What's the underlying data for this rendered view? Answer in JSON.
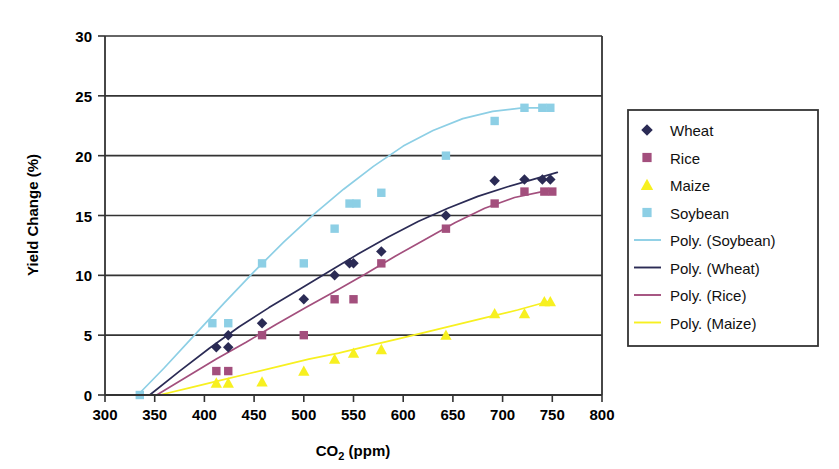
{
  "chart_data": {
    "type": "scatter",
    "title": "",
    "xlabel": "CO2  (ppm)",
    "xlabel_parts": {
      "main": "CO",
      "sub": "2",
      "unit": "(ppm)"
    },
    "ylabel": "Yield Change (%)",
    "xlim": [
      300,
      800
    ],
    "ylim": [
      0,
      30
    ],
    "xticks": [
      300,
      350,
      400,
      450,
      500,
      550,
      600,
      650,
      700,
      750,
      800
    ],
    "yticks": [
      0,
      5,
      10,
      15,
      20,
      25,
      30
    ],
    "xtick_labels": [
      "300",
      "350",
      "400",
      "450",
      "500",
      "550",
      "600",
      "650",
      "700",
      "750",
      "800"
    ],
    "ytick_labels": [
      "0",
      "5",
      "10",
      "15",
      "20",
      "25",
      "30"
    ],
    "grid": "horizontal",
    "legend_position": "right-outside",
    "series": [
      {
        "name": "Wheat",
        "marker": "diamond",
        "color": "#2b2b55",
        "points": [
          [
            412,
            4.0
          ],
          [
            424,
            4.0
          ],
          [
            424,
            5.0
          ],
          [
            458,
            6.0
          ],
          [
            500,
            8.0
          ],
          [
            531,
            10.0
          ],
          [
            546,
            11.0
          ],
          [
            550,
            11.0
          ],
          [
            578,
            12.0
          ],
          [
            643,
            15.0
          ],
          [
            692,
            17.9
          ],
          [
            722,
            18.0
          ],
          [
            740,
            18.0
          ],
          [
            748,
            18.0
          ]
        ]
      },
      {
        "name": "Rice",
        "marker": "square",
        "color": "#a34f7d",
        "points": [
          [
            412,
            2.0
          ],
          [
            424,
            2.0
          ],
          [
            458,
            5.0
          ],
          [
            500,
            5.0
          ],
          [
            531,
            8.0
          ],
          [
            550,
            8.0
          ],
          [
            578,
            11.0
          ],
          [
            643,
            13.9
          ],
          [
            692,
            16.0
          ],
          [
            722,
            17.0
          ],
          [
            742,
            17.0
          ],
          [
            750,
            17.0
          ]
        ]
      },
      {
        "name": "Maize",
        "marker": "triangle",
        "color": "#f7f020",
        "points": [
          [
            412,
            1.0
          ],
          [
            424,
            1.0
          ],
          [
            458,
            1.1
          ],
          [
            500,
            2.0
          ],
          [
            531,
            3.0
          ],
          [
            550,
            3.5
          ],
          [
            578,
            3.8
          ],
          [
            643,
            5.0
          ],
          [
            692,
            6.8
          ],
          [
            722,
            6.8
          ],
          [
            742,
            7.8
          ],
          [
            748,
            7.8
          ]
        ]
      },
      {
        "name": "Soybean",
        "marker": "square",
        "color": "#8dcfe5",
        "points": [
          [
            335,
            0.0
          ],
          [
            408,
            6.0
          ],
          [
            424,
            6.0
          ],
          [
            458,
            11.0
          ],
          [
            500,
            11.0
          ],
          [
            531,
            13.9
          ],
          [
            546,
            16.0
          ],
          [
            553,
            16.0
          ],
          [
            578,
            16.9
          ],
          [
            643,
            20.0
          ],
          [
            692,
            22.9
          ],
          [
            722,
            24.0
          ],
          [
            740,
            24.0
          ],
          [
            748,
            24.0
          ]
        ]
      }
    ],
    "trendlines": [
      {
        "name": "Poly. (Soybean)",
        "color": "#8dcfe5",
        "path": [
          [
            333,
            0.0
          ],
          [
            360,
            2.3
          ],
          [
            390,
            5.0
          ],
          [
            420,
            7.7
          ],
          [
            450,
            10.3
          ],
          [
            480,
            12.8
          ],
          [
            510,
            15.1
          ],
          [
            540,
            17.2
          ],
          [
            570,
            19.1
          ],
          [
            600,
            20.8
          ],
          [
            630,
            22.1
          ],
          [
            660,
            23.1
          ],
          [
            690,
            23.7
          ],
          [
            720,
            24.0
          ],
          [
            748,
            24.0
          ]
        ]
      },
      {
        "name": "Poly. (Wheat)",
        "color": "#2b2b55",
        "path": [
          [
            345,
            0.0
          ],
          [
            375,
            2.0
          ],
          [
            405,
            3.9
          ],
          [
            435,
            5.7
          ],
          [
            465,
            7.3
          ],
          [
            495,
            8.8
          ],
          [
            525,
            10.3
          ],
          [
            555,
            11.8
          ],
          [
            585,
            13.2
          ],
          [
            615,
            14.5
          ],
          [
            645,
            15.6
          ],
          [
            675,
            16.6
          ],
          [
            705,
            17.4
          ],
          [
            730,
            18.0
          ],
          [
            755,
            18.6
          ]
        ]
      },
      {
        "name": "Poly. (Rice)",
        "color": "#a34f7d",
        "path": [
          [
            352,
            0.0
          ],
          [
            382,
            1.5
          ],
          [
            412,
            3.0
          ],
          [
            442,
            4.4
          ],
          [
            472,
            5.9
          ],
          [
            502,
            7.3
          ],
          [
            532,
            8.7
          ],
          [
            562,
            10.1
          ],
          [
            592,
            11.6
          ],
          [
            622,
            13.0
          ],
          [
            652,
            14.4
          ],
          [
            682,
            15.6
          ],
          [
            712,
            16.5
          ],
          [
            740,
            17.0
          ],
          [
            752,
            17.1
          ]
        ]
      },
      {
        "name": "Poly. (Maize)",
        "color": "#f7f020",
        "path": [
          [
            355,
            0.0
          ],
          [
            385,
            0.6
          ],
          [
            415,
            1.2
          ],
          [
            445,
            1.8
          ],
          [
            475,
            2.4
          ],
          [
            505,
            3.0
          ],
          [
            535,
            3.5
          ],
          [
            565,
            4.1
          ],
          [
            595,
            4.7
          ],
          [
            625,
            5.3
          ],
          [
            655,
            5.9
          ],
          [
            685,
            6.5
          ],
          [
            715,
            7.1
          ],
          [
            745,
            7.8
          ]
        ]
      }
    ]
  },
  "legend": {
    "items": [
      {
        "label": "Wheat",
        "kind": "marker",
        "marker": "diamond",
        "color": "#2b2b55"
      },
      {
        "label": "Rice",
        "kind": "marker",
        "marker": "square",
        "color": "#a34f7d"
      },
      {
        "label": "Maize",
        "kind": "marker",
        "marker": "triangle",
        "color": "#f7f020"
      },
      {
        "label": "Soybean",
        "kind": "marker",
        "marker": "square",
        "color": "#8dcfe5"
      },
      {
        "label": "Poly. (Soybean)",
        "kind": "line",
        "color": "#8dcfe5"
      },
      {
        "label": "Poly. (Wheat)",
        "kind": "line",
        "color": "#2b2b55"
      },
      {
        "label": "Poly. (Rice)",
        "kind": "line",
        "color": "#a34f7d"
      },
      {
        "label": "Poly. (Maize)",
        "kind": "line",
        "color": "#f7f020"
      }
    ]
  },
  "colors": {
    "axis": "#333333",
    "grid": "#333333",
    "background": "#ffffff",
    "wheat": "#2b2b55",
    "rice": "#a34f7d",
    "maize": "#f7f020",
    "soybean": "#8dcfe5"
  }
}
